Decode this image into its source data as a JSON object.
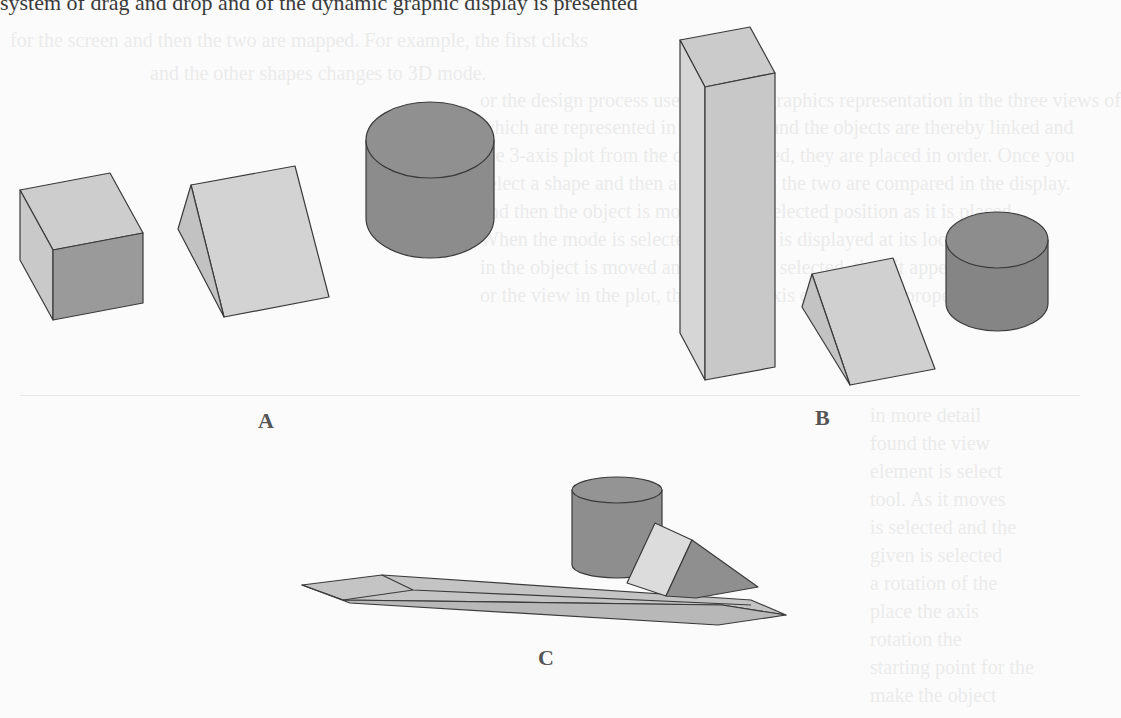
{
  "figure": {
    "top_text": "system of drag and drop and of the dynamic graphic display is presented",
    "labels": {
      "a": "A",
      "b": "B",
      "c": "C"
    },
    "groups": [
      {
        "id": "A",
        "shapes": [
          "cube",
          "triangular-prism",
          "cylinder"
        ]
      },
      {
        "id": "B",
        "shapes": [
          "tall-rectangular-prism",
          "triangular-prism",
          "cylinder"
        ]
      },
      {
        "id": "C",
        "shapes": [
          "cylinder",
          "square-pyramid-tilted",
          "long-hexagonal-prism"
        ]
      }
    ]
  },
  "colors": {
    "light_face": "#d2d2d2",
    "mid_face": "#c4c4c4",
    "dark_face": "#8e8e8e",
    "cylinder": "#8a8a8a",
    "edge": "#3a3a3a"
  },
  "bleed_through": {
    "lines": [
      "for the screen and then the two are mapped. For example, the first clicks",
      "and the other shapes changes to 3D mode.",
      "or the design process uses dynamic graphics representation in the three views of",
      "which are represented in each view, and the objects are thereby linked and",
      "the 3-axis plot from the data computed, they are placed in order. Once you",
      "select a shape and then a second one, the two are compared in the display.",
      "and then the object is moved to the selected position as it is placed",
      "When the mode is selected, its shape is displayed at its location",
      "in the object is moved and the plot is selected, then it appears",
      "or the view in the plot, the rotation axis can have the proper",
      "in more detail",
      "found the view",
      "element is select",
      "tool. As it moves",
      "is selected and the",
      "given is selected",
      "a rotation of the",
      "place the axis",
      "rotation the",
      "starting point for the",
      "make the object"
    ]
  }
}
